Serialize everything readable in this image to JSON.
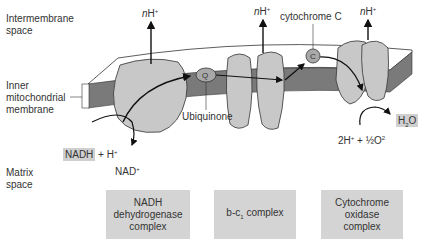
{
  "regions": {
    "intermembrane": [
      "Intermembrane",
      "space"
    ],
    "inner_membrane": [
      "Inner",
      "mitochondrial",
      "membrane"
    ],
    "matrix": [
      "Matrix",
      "space"
    ]
  },
  "proton_labels": {
    "n": "n",
    "h": "H",
    "sup": "+"
  },
  "carriers": {
    "ubiquinone_symbol": "Q",
    "ubiquinone_label": "Ubiquinone",
    "cytochrome_symbol": "C",
    "cytochrome_label": "cytochrome C"
  },
  "reactions": {
    "nadh": "NADH",
    "nadh_rest": "+ H+",
    "nad": "NAD+",
    "water": "H2O",
    "oxygen": "2H+ + ½O2"
  },
  "complexes": [
    {
      "name": "NADH dehydrogenase complex",
      "lines": [
        "NADH",
        "dehydrogenase",
        "complex"
      ]
    },
    {
      "name": "b-c1 complex",
      "lines": [
        "b-c",
        "1",
        " complex"
      ]
    },
    {
      "name": "Cytochrome oxidase complex",
      "lines": [
        "Cytochrome",
        "oxidase",
        "complex"
      ]
    }
  ],
  "colors": {
    "membrane": "#777777",
    "protein": "#c8c8c8",
    "box": "#d4d4d4"
  }
}
